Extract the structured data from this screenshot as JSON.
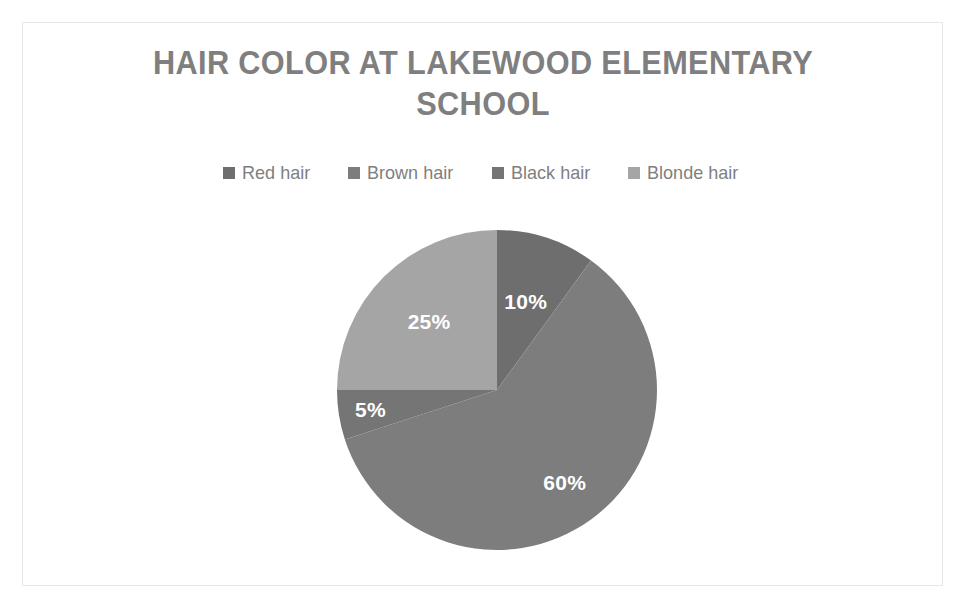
{
  "chart_data": {
    "type": "pie",
    "title": "HAIR COLOR AT LAKEWOOD ELEMENTARY SCHOOL",
    "title_line1": "HAIR COLOR AT LAKEWOOD ELEMENTARY",
    "title_line2": "SCHOOL",
    "categories": [
      "Red hair",
      "Brown hair",
      "Black hair",
      "Blonde hair"
    ],
    "values": [
      10,
      60,
      5,
      25
    ],
    "value_labels": [
      "10%",
      "60%",
      "5%",
      "25%"
    ],
    "unit": "percent",
    "total": 100,
    "start_angle_deg": 0,
    "direction": "clockwise",
    "legend_position": "top",
    "grid": false,
    "xlabel": "",
    "ylabel": "",
    "colors": [
      "#6e6e6e",
      "#7d7d7d",
      "#757575",
      "#a5a5a5"
    ],
    "slices": [
      {
        "label": "Red hair",
        "value": 10,
        "value_label": "10%",
        "color": "#6e6e6e",
        "start_deg": 0,
        "end_deg": 36
      },
      {
        "label": "Brown hair",
        "value": 60,
        "value_label": "60%",
        "color": "#7d7d7d",
        "start_deg": 36,
        "end_deg": 252
      },
      {
        "label": "Black hair",
        "value": 5,
        "value_label": "5%",
        "color": "#757575",
        "start_deg": 252,
        "end_deg": 270
      },
      {
        "label": "Blonde hair",
        "value": 25,
        "value_label": "25%",
        "color": "#a5a5a5",
        "start_deg": 270,
        "end_deg": 360
      }
    ]
  },
  "title": {
    "line1": "HAIR COLOR AT LAKEWOOD ELEMENTARY",
    "line2": "SCHOOL",
    "color": "#7f7f7f"
  },
  "legend": {
    "items": [
      {
        "label": "Red hair",
        "color": "#6e6e6e"
      },
      {
        "label": "Brown hair",
        "color": "#7d7d7d"
      },
      {
        "label": "Black hair",
        "color": "#757575"
      },
      {
        "label": "Blonde hair",
        "color": "#a5a5a5"
      }
    ]
  },
  "labels": {
    "red": "10%",
    "brown": "60%",
    "black": "5%",
    "blonde": "25%"
  },
  "theme": {
    "background": "#ffffff",
    "frame_border": "#e8e8e8",
    "text_gray": "#7f7f7f",
    "label_text": "#ffffff"
  }
}
